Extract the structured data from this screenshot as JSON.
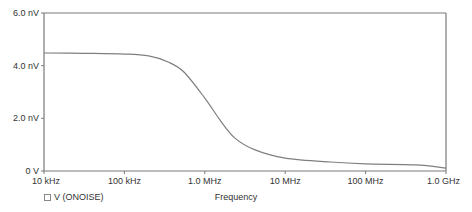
{
  "chart_data": {
    "type": "line",
    "title": "",
    "xlabel": "Frequency",
    "ylabel": "",
    "xscale": "log",
    "xlim": [
      10000,
      1000000000
    ],
    "ylim": [
      0,
      6.0
    ],
    "y_unit": "nV",
    "grid": false,
    "legend_position": "bottom-left",
    "x_ticks": [
      {
        "value": 10000,
        "label": "10 kHz"
      },
      {
        "value": 100000,
        "label": "100 kHz"
      },
      {
        "value": 1000000,
        "label": "1.0 MHz"
      },
      {
        "value": 10000000,
        "label": "10 MHz"
      },
      {
        "value": 100000000,
        "label": "100 MHz"
      },
      {
        "value": 1000000000,
        "label": "1.0 GHz"
      }
    ],
    "y_ticks": [
      {
        "value": 0,
        "label": "0 V"
      },
      {
        "value": 2.0,
        "label": "2.0 nV"
      },
      {
        "value": 4.0,
        "label": "4.0 nV"
      },
      {
        "value": 6.0,
        "label": "6.0 nV"
      }
    ],
    "series": [
      {
        "name": "V (ONOISE)",
        "color": "#7f7f7f",
        "x": [
          10000,
          31600,
          100000,
          200000,
          350000,
          550000,
          1000000,
          1540000,
          2370000,
          4220000,
          10000000,
          36500000,
          100000000,
          420000000,
          1000000000
        ],
        "values": [
          4.48,
          4.47,
          4.44,
          4.37,
          4.14,
          3.76,
          2.77,
          1.94,
          1.25,
          0.8,
          0.49,
          0.34,
          0.27,
          0.23,
          0.11
        ]
      }
    ]
  },
  "legend": {
    "items": [
      {
        "label": "V (ONOISE)"
      }
    ]
  },
  "axis": {
    "x_title": "Frequency"
  }
}
